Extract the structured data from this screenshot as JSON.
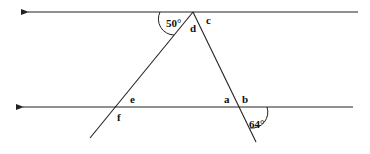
{
  "diagram": {
    "type": "parallel-lines-with-transversals",
    "lines": {
      "top_parallel": {
        "x1": 358,
        "y": 12,
        "x2": 25,
        "arrow": "left"
      },
      "bottom_parallel": {
        "x1": 353,
        "y": 107,
        "x2": 20,
        "arrow": "left"
      },
      "left_transversal": {
        "x1": 193,
        "y1": 12,
        "x2": 90,
        "y2": 138
      },
      "right_transversal": {
        "x1": 193,
        "y1": 12,
        "x2": 256,
        "y2": 142
      }
    },
    "angle_labels": [
      {
        "id": "angle-50",
        "text": "50°",
        "x": 166,
        "y": 27
      },
      {
        "id": "angle-64",
        "text": "64°",
        "x": 249,
        "y": 128
      },
      {
        "id": "angle-a",
        "text": "a",
        "x": 224,
        "y": 103
      },
      {
        "id": "angle-b",
        "text": "b",
        "x": 242,
        "y": 103
      },
      {
        "id": "angle-c",
        "text": "c",
        "x": 206,
        "y": 24
      },
      {
        "id": "angle-d",
        "text": "d",
        "x": 190,
        "y": 32
      },
      {
        "id": "angle-e",
        "text": "e",
        "x": 130,
        "y": 103
      },
      {
        "id": "angle-f",
        "text": "f",
        "x": 117,
        "y": 121
      }
    ]
  }
}
